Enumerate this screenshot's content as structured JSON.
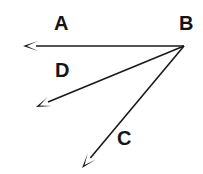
{
  "diagram": {
    "type": "vector-diagram",
    "title": "",
    "background_color": "#ffffff",
    "stroke_color": "#1a1a1a",
    "label_color": "#141414",
    "origin": {
      "name": "B",
      "x": 184,
      "y": 46
    },
    "labels": [
      {
        "id": "A",
        "text": "A",
        "x": 54,
        "y": 13
      },
      {
        "id": "B",
        "text": "B",
        "x": 179,
        "y": 13
      },
      {
        "id": "C",
        "text": "C",
        "x": 117,
        "y": 128
      },
      {
        "id": "D",
        "text": "D",
        "x": 55,
        "y": 60
      }
    ],
    "vectors": [
      {
        "id": "A",
        "label": "A",
        "from_x": 184,
        "from_y": 46,
        "to_x": 23,
        "to_y": 46,
        "stroke_width": 1.6,
        "arrowhead": "solid-triangle"
      },
      {
        "id": "D",
        "label": "D",
        "from_x": 184,
        "from_y": 46,
        "to_x": 36,
        "to_y": 107,
        "stroke_width": 1.6,
        "arrowhead": "solid-triangle"
      },
      {
        "id": "C",
        "label": "C",
        "from_x": 184,
        "from_y": 46,
        "to_x": 82,
        "to_y": 168,
        "stroke_width": 1.6,
        "arrowhead": "solid-triangle"
      }
    ]
  }
}
